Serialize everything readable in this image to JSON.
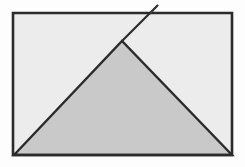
{
  "figure": {
    "title": "Rectangle with inscribed shaded triangle and extended apex line",
    "caption": "",
    "canvas": {
      "width": 245,
      "height": 167,
      "background": "#fdfdfd"
    },
    "palette": {
      "outer_background": "#fdfdfd",
      "rectangle_fill": "#ececec",
      "triangle_fill": "#c9c9c9",
      "stroke_dark": "#2b2b2b",
      "stroke_mid": "#3a3a3a"
    },
    "strokes": {
      "rectangle_width": 2.6,
      "triangle_width": 2.4,
      "extension_width": 2.2,
      "hook_width": 1.4
    },
    "shapes": [
      {
        "name": "rectangle",
        "type": "rect",
        "label": "Rectangle",
        "x": 13,
        "y": 13,
        "width": 219,
        "height": 142,
        "points": "13,13 232,13 232,155 13,155",
        "fill": "#ececec",
        "stroke": "#2b2b2b"
      },
      {
        "name": "shaded-triangle",
        "type": "polygon",
        "label": "Shaded triangle",
        "points": "14,155 122,41 232,155",
        "apex": {
          "x": 122,
          "y": 41
        },
        "base_left": {
          "x": 14,
          "y": 155
        },
        "base_right": {
          "x": 232,
          "y": 155
        },
        "fill": "#c9c9c9",
        "stroke": "#2b2b2b"
      },
      {
        "name": "apex-extension-line",
        "type": "polyline",
        "label": "Extension of left triangle side beyond the apex",
        "points": "122,41 158,5",
        "crosses_top_edge_at": {
          "x": 148,
          "y": 14
        },
        "tip": {
          "x": 158,
          "y": 5
        },
        "stroke": "#2b2b2b"
      },
      {
        "name": "hook-return-line",
        "type": "polyline",
        "label": "Short return stroke forming a small flag above the top edge",
        "points": "158,5 150,14",
        "stroke": "#3a3a3a"
      }
    ],
    "vertices": [
      {
        "name": "rect-top-left",
        "x": 13,
        "y": 13
      },
      {
        "name": "rect-top-right",
        "x": 232,
        "y": 13
      },
      {
        "name": "rect-bottom-right",
        "x": 232,
        "y": 155
      },
      {
        "name": "rect-bottom-left",
        "x": 13,
        "y": 155
      },
      {
        "name": "triangle-apex",
        "x": 122,
        "y": 41
      },
      {
        "name": "line-top-edge-crossing",
        "x": 148,
        "y": 14
      },
      {
        "name": "line-tip",
        "x": 158,
        "y": 5
      },
      {
        "name": "hook-foot",
        "x": 150,
        "y": 14
      }
    ]
  }
}
